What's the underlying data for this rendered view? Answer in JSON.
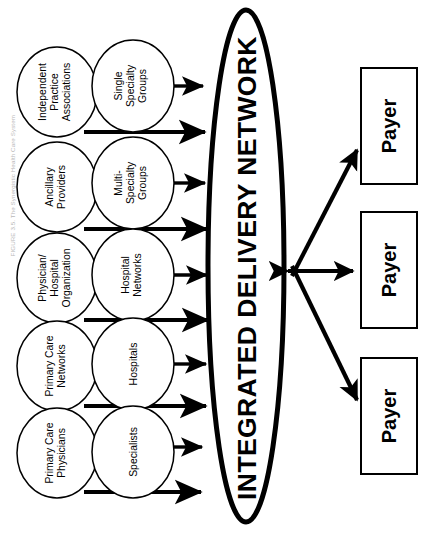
{
  "figure": {
    "caption": "FIGURE 3.5.  The Synergistic Health Care System",
    "center_node": {
      "label": "INTEGRATED DELIVERY NETWORK",
      "shape": "ellipse"
    }
  },
  "provider_column_outer": {
    "shape": "ellipse",
    "items": [
      {
        "id": "ipa",
        "label_lines": [
          "Independent",
          "Practice",
          "Associations"
        ]
      },
      {
        "id": "ancillary",
        "label_lines": [
          "Ancillary",
          "Providers"
        ]
      },
      {
        "id": "pho",
        "label_lines": [
          "Physician/",
          "Hospital",
          "Organization"
        ]
      },
      {
        "id": "pcn",
        "label_lines": [
          "Primary Care",
          "Networks"
        ]
      },
      {
        "id": "pcp",
        "label_lines": [
          "Primary Care",
          "Physicians"
        ]
      }
    ]
  },
  "provider_column_inner": {
    "shape": "ellipse",
    "items": [
      {
        "id": "ssg",
        "label_lines": [
          "Single",
          "Specialty",
          "Groups"
        ]
      },
      {
        "id": "msg",
        "label_lines": [
          "Multi-",
          "Specialty",
          "Groups"
        ]
      },
      {
        "id": "hospnet",
        "label_lines": [
          "Hospital",
          "Networks"
        ]
      },
      {
        "id": "hospitals",
        "label_lines": [
          "Hospitals"
        ]
      },
      {
        "id": "specialists",
        "label_lines": [
          "Specialists"
        ]
      }
    ]
  },
  "payers": {
    "shape": "rectangle",
    "items": [
      {
        "id": "payer-top",
        "label": "Payer",
        "arrow": "one-way-from-network"
      },
      {
        "id": "payer-middle",
        "label": "Payer",
        "arrow": "two-way"
      },
      {
        "id": "payer-bottom",
        "label": "Payer",
        "arrow": "one-way-from-network"
      }
    ]
  },
  "colors": {
    "stroke": "#000000",
    "fill": "#ffffff",
    "caption": "#b9b9b9"
  }
}
